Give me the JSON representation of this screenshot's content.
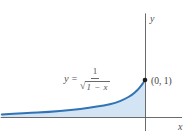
{
  "figure": {
    "colors": {
      "background": "#ffffff",
      "curve": "#3173b4",
      "area_fill": "#d3e5f4",
      "axis": "#5a5a5a",
      "point": "#1d1d1d",
      "text": "#4f4f4f"
    },
    "labels": {
      "x_axis": "x",
      "y_axis": "y",
      "point": "(0, 1)"
    },
    "equation": {
      "lhs": "y",
      "equals": "=",
      "numerator": "1",
      "radical_sign": "√",
      "radicand": "1 − x",
      "full": "y = 1/√(1 − x)"
    }
  },
  "chart_data": {
    "type": "area",
    "title": "",
    "formula": "y = 1/sqrt(1 - x)",
    "xlabel": "x",
    "ylabel": "y",
    "xlim": [
      -3.9,
      1.0
    ],
    "ylim": [
      0,
      2.8
    ],
    "grid": false,
    "marked_point": {
      "x": 0,
      "y": 1,
      "label": "(0, 1)"
    },
    "shaded_region": "area under the curve from left edge (x ≈ -3.9) to x = 0",
    "curve": {
      "x": [
        -3.87,
        -3.2,
        -2.6,
        -2.0,
        -1.5,
        -1.1,
        -0.8,
        -0.55,
        -0.35,
        -0.2,
        -0.1,
        0
      ],
      "y": [
        0.07,
        0.1,
        0.14,
        0.19,
        0.25,
        0.31,
        0.38,
        0.48,
        0.6,
        0.73,
        0.85,
        1.0
      ]
    }
  }
}
